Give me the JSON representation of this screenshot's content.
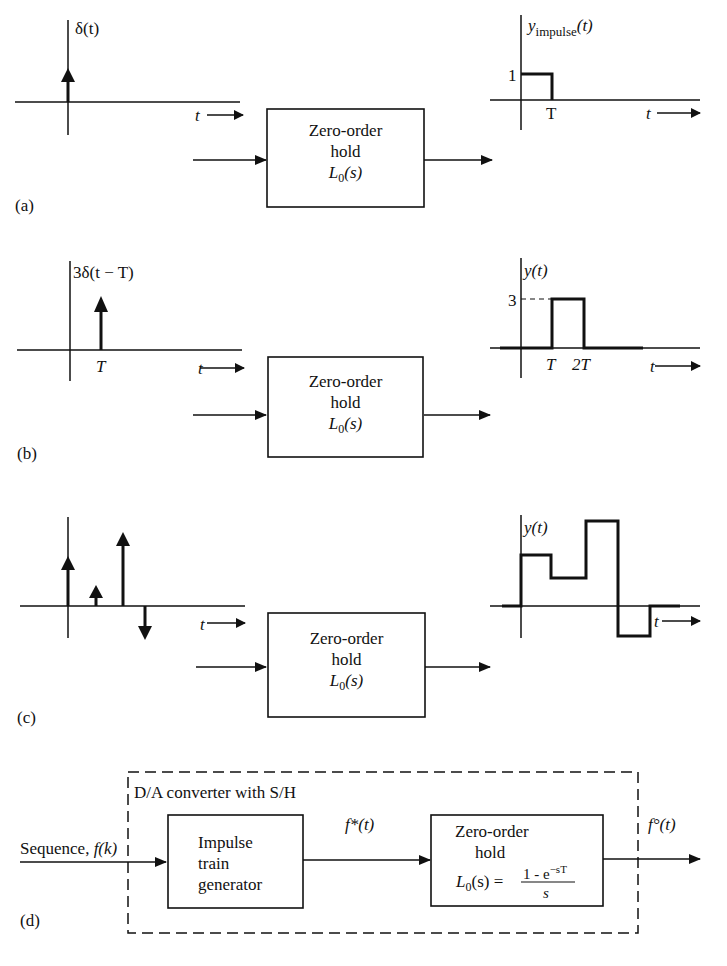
{
  "panels": {
    "a": {
      "label": "(a)",
      "input_label": "δ(t)",
      "t_axis": "t",
      "box": {
        "line1": "Zero-order",
        "line2": "hold",
        "transfer": "L",
        "transfer_sub": "0",
        "transfer_arg": "(s)"
      },
      "output_label_main": "y",
      "output_label_sub": "impulse",
      "output_label_arg": "(t)",
      "output_level": "1",
      "output_tick": "T"
    },
    "b": {
      "label": "(b)",
      "input_label": "3δ(t − T)",
      "input_tick": "T",
      "t_axis": "t",
      "box": {
        "line1": "Zero-order",
        "line2": "hold",
        "transfer": "L",
        "transfer_sub": "0",
        "transfer_arg": "(s)"
      },
      "output_label": "y(t)",
      "output_level": "3",
      "output_ticks": [
        "T",
        "2T"
      ]
    },
    "c": {
      "label": "(c)",
      "t_axis": "t",
      "impulses_relative": [
        2,
        0.6,
        3,
        -1
      ],
      "box": {
        "line1": "Zero-order",
        "line2": "hold",
        "transfer": "L",
        "transfer_sub": "0",
        "transfer_arg": "(s)"
      },
      "output_label": "y(t)"
    },
    "d": {
      "label": "(d)",
      "container_label": "D/A converter with S/H",
      "input_label": "Sequence, ",
      "input_label_fn": "f(k)",
      "block1": {
        "line1": "Impulse",
        "line2": "train",
        "line3": "generator"
      },
      "mid_signal": "f*(t)",
      "block2": {
        "line1": "Zero-order",
        "line2": "hold",
        "transfer": "L",
        "transfer_sub": "0",
        "transfer_eq": "(s) =",
        "numerator": "1 - e",
        "numerator_exp": "−sT",
        "denominator": "s"
      },
      "output_signal": "f°(t)"
    }
  }
}
